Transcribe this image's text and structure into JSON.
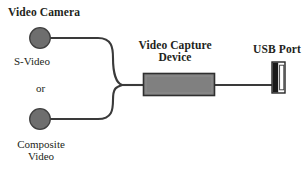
{
  "diagram": {
    "background_color": "#ffffff",
    "labels": {
      "video_camera": "Video Camera",
      "s_video": "S-Video",
      "or": "or",
      "composite_video": "Composite\nVideo",
      "capture_device": "Video Capture\nDevice",
      "usb_port": "USB Port"
    },
    "colors": {
      "outline": "#333333",
      "cable": "#3a3a3a",
      "connector_fill": "#6e6e6e",
      "device_fill": "#808080",
      "usb_dark": "#1a1a1a",
      "usb_light": "#ffffff",
      "text": "#231f20"
    },
    "nodes": [
      {
        "name": "s-video-connector",
        "shape": "circle",
        "cx": 40,
        "cy": 38,
        "r": 10.5,
        "fill": "#6e6e6e"
      },
      {
        "name": "composite-video-connector",
        "shape": "circle",
        "cx": 40,
        "cy": 119,
        "r": 10.5,
        "fill": "#6e6e6e"
      },
      {
        "name": "video-capture-device-body",
        "shape": "rect",
        "x": 143,
        "y": 73,
        "width": 72,
        "height": 23,
        "fill": "#808080"
      },
      {
        "name": "usb-port-body",
        "shape": "rect",
        "x": 272,
        "y": 62,
        "width": 13,
        "height": 31,
        "fill": "#ffffff"
      }
    ],
    "cables": [
      {
        "name": "s-video-cable",
        "from": "s-video-connector",
        "to": "merge-point",
        "path": "M 50 38 L 98 38 C 112 38 113 48 113 58 C 113 72 116 83 122 85"
      },
      {
        "name": "composite-video-cable",
        "from": "composite-video-connector",
        "to": "merge-point",
        "path": "M 50 119 L 98 119 C 112 119 113 110 113 100 C 113 88 116 87 122 85"
      },
      {
        "name": "merge-to-device-cable",
        "from": "merge-point",
        "to": "video-capture-device-body",
        "path": "M 122 85 L 143 85"
      },
      {
        "name": "device-to-usb-cable",
        "from": "video-capture-device-body",
        "to": "usb-port-body",
        "path": "M 215 85 L 272 85"
      }
    ]
  }
}
